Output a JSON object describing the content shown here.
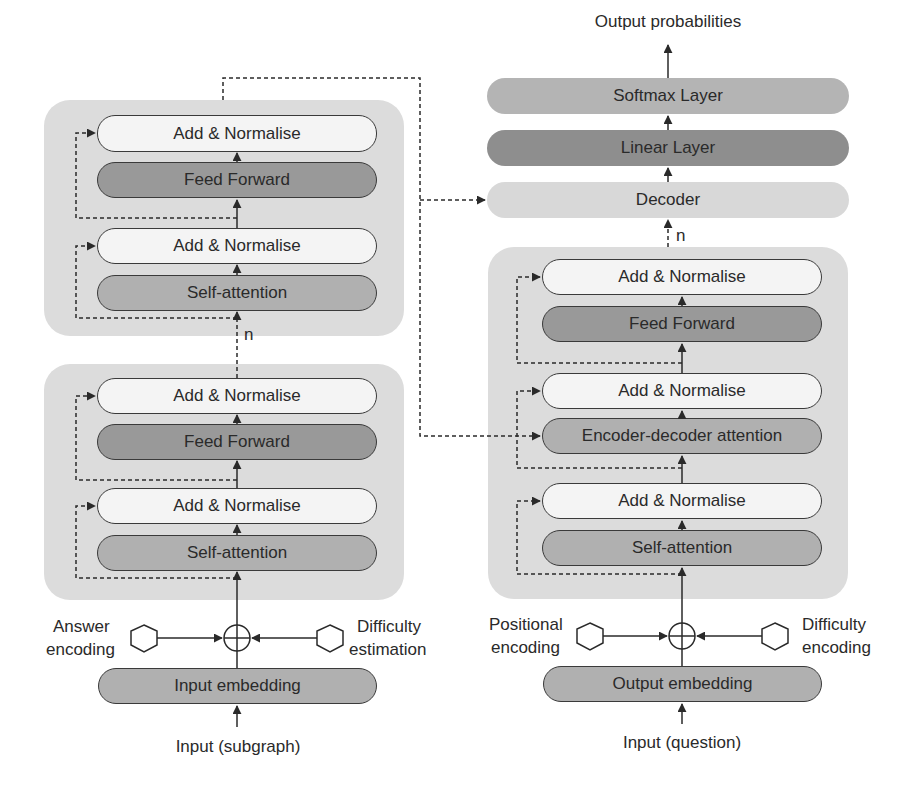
{
  "colors": {
    "container": "#dcdcdc",
    "add_normalise": "#f4f4f4",
    "self_attention": "#b0b0b0",
    "feed_forward": "#999999",
    "softmax": "#b4b4b4",
    "linear": "#8e8e8e",
    "decoder": "#d8d8d8",
    "stroke": "#3a3a3a"
  },
  "encoder": {
    "top_block": {
      "layers": [
        "Add & Normalise",
        "Feed Forward",
        "Add & Normalise",
        "Self-attention"
      ]
    },
    "repeat_label": "n",
    "bottom_block": {
      "layers": [
        "Add & Normalise",
        "Feed Forward",
        "Add & Normalise",
        "Self-attention"
      ]
    },
    "left_encoding": {
      "line1": "Answer",
      "line2": "encoding"
    },
    "right_encoding": {
      "line1": "Difficulty",
      "line2": "estimation"
    },
    "embedding": "Input embedding",
    "input": "Input (subgraph)"
  },
  "decoder": {
    "output_label": "Output probabilities",
    "softmax": "Softmax Layer",
    "linear": "Linear Layer",
    "decoder_label": "Decoder",
    "repeat_label": "n",
    "block": {
      "layers": [
        "Add & Normalise",
        "Feed Forward",
        "Add & Normalise",
        "Encoder-decoder attention",
        "Add & Normalise",
        "Self-attention"
      ]
    },
    "left_encoding": {
      "line1": "Positional",
      "line2": "encoding"
    },
    "right_encoding": {
      "line1": "Difficulty",
      "line2": "encoding"
    },
    "embedding": "Output embedding",
    "input": "Input (question)"
  }
}
